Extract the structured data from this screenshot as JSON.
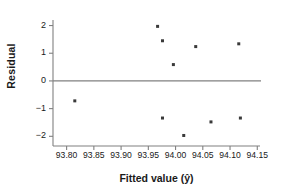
{
  "chart_data": {
    "type": "scatter",
    "title": "",
    "xlabel": "Fitted value (ŷ)",
    "ylabel": "Residual",
    "xlim": [
      93.775,
      94.155
    ],
    "ylim": [
      -2.35,
      2.2
    ],
    "xticks": [
      93.8,
      93.85,
      93.9,
      93.95,
      94.0,
      94.05,
      94.1,
      94.15
    ],
    "xticklabels": [
      "93.80",
      "93.85",
      "93.90",
      "93.95",
      "94.00",
      "94.05",
      "94.10",
      "94.15"
    ],
    "yticks": [
      2,
      1,
      0,
      -1,
      -2
    ],
    "yticklabels": [
      "2",
      "1",
      "0",
      "−1",
      "−2"
    ],
    "grid": false,
    "legend": null,
    "reference_line": {
      "y": 0,
      "orientation": "horizontal",
      "color": "#808080"
    },
    "marker": {
      "shape": "square",
      "size": 3,
      "color": "#3a3a3a"
    },
    "points": [
      {
        "x": 93.815,
        "y": -0.72
      },
      {
        "x": 93.967,
        "y": 1.97
      },
      {
        "x": 93.976,
        "y": 1.45
      },
      {
        "x": 93.976,
        "y": -1.34
      },
      {
        "x": 93.996,
        "y": 0.59
      },
      {
        "x": 94.015,
        "y": -1.97
      },
      {
        "x": 94.037,
        "y": 1.24
      },
      {
        "x": 94.065,
        "y": -1.48
      },
      {
        "x": 94.116,
        "y": 1.34
      },
      {
        "x": 94.119,
        "y": -1.34
      }
    ]
  },
  "axes": {
    "spine_color": "#808080",
    "tick_color": "#808080",
    "text_color": "#1a1a1a"
  }
}
